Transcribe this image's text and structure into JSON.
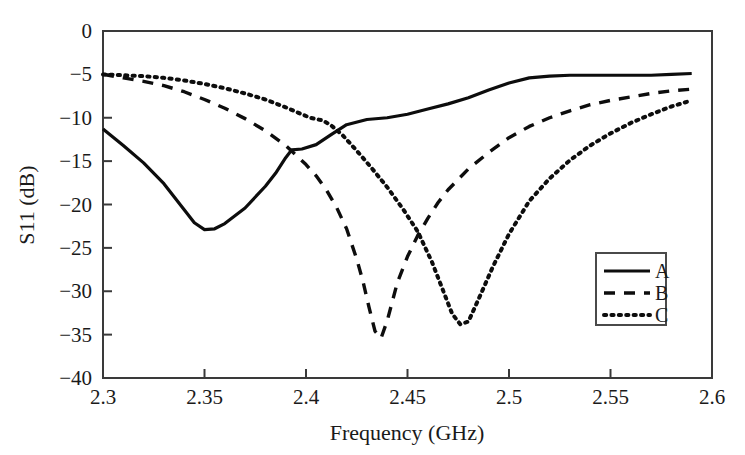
{
  "chart_data": {
    "type": "line",
    "title": "",
    "xlabel": "Frequency (GHz)",
    "ylabel": "S11 (dB)",
    "xlim": [
      2.3,
      2.6
    ],
    "ylim": [
      -40,
      0
    ],
    "grid": false,
    "legend_position": "right-center",
    "xticks": [
      "2.3",
      "2.35",
      "2.4",
      "2.45",
      "2.5",
      "2.55",
      "2.6"
    ],
    "xtick_values": [
      2.3,
      2.35,
      2.4,
      2.45,
      2.5,
      2.55,
      2.6
    ],
    "yticks": [
      "0",
      "−5",
      "−10",
      "−15",
      "−20",
      "−25",
      "−30",
      "−35",
      "−40"
    ],
    "ytick_values": [
      0,
      -5,
      -10,
      -15,
      -20,
      -25,
      -30,
      -35,
      -40
    ],
    "series": [
      {
        "name": "A",
        "style": "solid",
        "x": [
          2.3,
          2.31,
          2.32,
          2.33,
          2.34,
          2.345,
          2.35,
          2.355,
          2.36,
          2.37,
          2.38,
          2.385,
          2.39,
          2.393,
          2.398,
          2.405,
          2.412,
          2.42,
          2.43,
          2.44,
          2.45,
          2.46,
          2.47,
          2.48,
          2.49,
          2.5,
          2.51,
          2.52,
          2.53,
          2.54,
          2.55,
          2.56,
          2.57,
          2.58,
          2.59
        ],
        "y": [
          -11.3,
          -13.2,
          -15.2,
          -17.6,
          -20.6,
          -22.1,
          -22.9,
          -22.8,
          -22.2,
          -20.4,
          -17.9,
          -16.4,
          -14.6,
          -13.7,
          -13.6,
          -13.1,
          -12.0,
          -10.8,
          -10.2,
          -10.0,
          -9.6,
          -9.0,
          -8.4,
          -7.7,
          -6.8,
          -6.0,
          -5.4,
          -5.2,
          -5.1,
          -5.1,
          -5.1,
          -5.1,
          -5.1,
          -5.0,
          -4.9
        ]
      },
      {
        "name": "B",
        "style": "dashed",
        "x": [
          2.3,
          2.31,
          2.32,
          2.33,
          2.34,
          2.35,
          2.36,
          2.37,
          2.38,
          2.39,
          2.4,
          2.405,
          2.41,
          2.415,
          2.42,
          2.425,
          2.428,
          2.431,
          2.434,
          2.437,
          2.44,
          2.445,
          2.45,
          2.455,
          2.46,
          2.465,
          2.47,
          2.48,
          2.49,
          2.5,
          2.51,
          2.52,
          2.53,
          2.54,
          2.55,
          2.56,
          2.57,
          2.58,
          2.59
        ],
        "y": [
          -5.0,
          -5.4,
          -5.8,
          -6.3,
          -7.0,
          -7.9,
          -8.9,
          -10.1,
          -11.5,
          -13.2,
          -15.4,
          -16.7,
          -18.3,
          -20.3,
          -22.8,
          -26.3,
          -28.8,
          -31.8,
          -34.6,
          -35.4,
          -33.4,
          -29.0,
          -26.0,
          -23.6,
          -21.6,
          -19.8,
          -18.3,
          -15.9,
          -14.0,
          -12.3,
          -11.0,
          -10.0,
          -9.2,
          -8.5,
          -8.0,
          -7.6,
          -7.2,
          -6.9,
          -6.7
        ]
      },
      {
        "name": "C",
        "style": "dotted",
        "x": [
          2.3,
          2.31,
          2.32,
          2.33,
          2.34,
          2.35,
          2.36,
          2.37,
          2.38,
          2.39,
          2.396,
          2.402,
          2.408,
          2.412,
          2.418,
          2.425,
          2.432,
          2.44,
          2.448,
          2.455,
          2.462,
          2.468,
          2.472,
          2.476,
          2.48,
          2.486,
          2.492,
          2.5,
          2.51,
          2.52,
          2.53,
          2.54,
          2.55,
          2.56,
          2.57,
          2.58,
          2.59
        ],
        "y": [
          -5.0,
          -5.1,
          -5.2,
          -5.4,
          -5.7,
          -6.1,
          -6.6,
          -7.2,
          -7.9,
          -8.8,
          -9.4,
          -10.0,
          -10.3,
          -10.8,
          -12.0,
          -13.8,
          -15.7,
          -18.0,
          -20.6,
          -23.1,
          -26.6,
          -30.2,
          -32.6,
          -33.8,
          -33.5,
          -30.4,
          -27.2,
          -23.4,
          -19.6,
          -17.0,
          -14.9,
          -13.2,
          -11.8,
          -10.6,
          -9.6,
          -8.7,
          -8.0
        ]
      }
    ],
    "annotations": {
      "a_minimum": {
        "x": 2.35,
        "y": -22.9
      },
      "b_minimum": {
        "x": 2.434,
        "y": -35.4
      },
      "c_minimum": {
        "x": 2.472,
        "y": -33.8
      }
    }
  },
  "legend": {
    "entries": [
      {
        "label": "A",
        "style": "solid"
      },
      {
        "label": "B",
        "style": "dashed"
      },
      {
        "label": "C",
        "style": "dotted"
      }
    ]
  }
}
